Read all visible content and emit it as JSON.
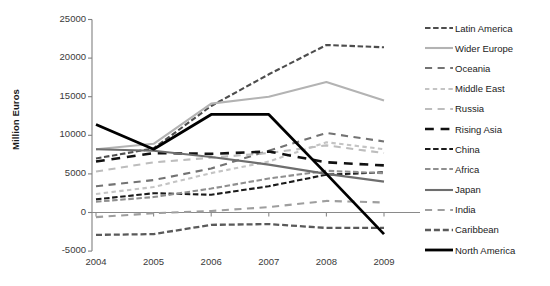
{
  "chart_data": {
    "type": "line",
    "title": "",
    "xlabel": "",
    "ylabel": "Million Euros",
    "categories": [
      "2004",
      "2005",
      "2006",
      "2007",
      "2008",
      "2009"
    ],
    "x": [
      2004,
      2005,
      2006,
      2007,
      2008,
      2009
    ],
    "ylim": [
      -5000,
      25000
    ],
    "ytick_labels": [
      "25000",
      "20000",
      "15000",
      "10000",
      "5000",
      "0",
      "-5000"
    ],
    "yticks": [
      25000,
      20000,
      15000,
      10000,
      5000,
      0,
      -5000
    ],
    "grid": false,
    "legend_position": "right",
    "series": [
      {
        "name": "Latin America",
        "color": "#4d4d4d",
        "style": "dashed-long",
        "width": 2.1,
        "values": [
          7000,
          8300,
          13800,
          17900,
          21700,
          21400
        ]
      },
      {
        "name": "Wider Europe",
        "color": "#b3b3b3",
        "style": "solid",
        "width": 2.1,
        "values": [
          8200,
          8900,
          14100,
          15000,
          16900,
          14500
        ]
      },
      {
        "name": "Oceania",
        "color": "#737373",
        "style": "dashed-wide",
        "width": 2.1,
        "values": [
          3400,
          4200,
          5700,
          8000,
          10300,
          9200
        ]
      },
      {
        "name": "Middle East",
        "color": "#c4c4c4",
        "style": "dashed-short",
        "width": 2.1,
        "values": [
          2400,
          3300,
          5100,
          6600,
          9100,
          8200
        ]
      },
      {
        "name": "Russia",
        "color": "#bdbdbd",
        "style": "dashed-wide",
        "width": 2.1,
        "values": [
          5300,
          6500,
          7100,
          7700,
          8700,
          7700
        ]
      },
      {
        "name": "Rising Asia",
        "color": "#111111",
        "style": "dashed-wide",
        "width": 2.6,
        "values": [
          6600,
          7700,
          7600,
          7900,
          6500,
          6100
        ]
      },
      {
        "name": "China",
        "color": "#1a1a1a",
        "style": "dashed-long",
        "width": 2.1,
        "values": [
          1700,
          2500,
          2300,
          3400,
          4900,
          5200
        ]
      },
      {
        "name": "Africa",
        "color": "#8f8f8f",
        "style": "dashed-long",
        "width": 2.1,
        "values": [
          1400,
          2000,
          3100,
          4400,
          5400,
          5100
        ]
      },
      {
        "name": "Japan",
        "color": "#6e6e6e",
        "style": "solid",
        "width": 2.1,
        "values": [
          8200,
          8000,
          7200,
          6200,
          5000,
          4000
        ]
      },
      {
        "name": "India",
        "color": "#9e9e9e",
        "style": "dashed-wide",
        "width": 2.1,
        "values": [
          -600,
          -100,
          200,
          700,
          1500,
          1300
        ]
      },
      {
        "name": "Caribbean",
        "color": "#5a5a5a",
        "style": "dashed-long",
        "width": 2.3,
        "values": [
          -2900,
          -2800,
          -1600,
          -1500,
          -2000,
          -2000
        ]
      },
      {
        "name": "North America",
        "color": "#000000",
        "style": "solid",
        "width": 2.8,
        "values": [
          11400,
          8200,
          12700,
          12700,
          5000,
          -2800
        ]
      }
    ]
  },
  "legend": {
    "items": [
      {
        "label": "Latin America"
      },
      {
        "label": "Wider Europe"
      },
      {
        "label": "Oceania"
      },
      {
        "label": "Middle East"
      },
      {
        "label": "Russia"
      },
      {
        "label": "Rising Asia"
      },
      {
        "label": "China"
      },
      {
        "label": "Africa"
      },
      {
        "label": "Japan"
      },
      {
        "label": "India"
      },
      {
        "label": "Caribbean"
      },
      {
        "label": "North America"
      }
    ]
  },
  "axes": {
    "y_title": "Million Euros",
    "axis_color": "#808080"
  }
}
